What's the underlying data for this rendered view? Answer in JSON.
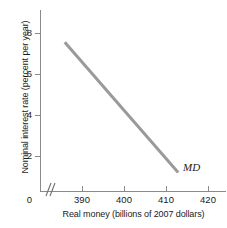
{
  "chart_data": {
    "type": "line",
    "title": "",
    "subtitle": "",
    "xlabel": "Real money (billions of 2007 dollars)",
    "ylabel": "Nominal interest rate (percent per year)",
    "xlim": [
      385,
      422
    ],
    "ylim": [
      0,
      8.9
    ],
    "grid": false,
    "legend_position": "inline-right",
    "axis_break_x": true,
    "origin_label": "0",
    "xticks": [
      390,
      400,
      410,
      420
    ],
    "xtick_labels": [
      "390",
      "400",
      "410",
      "420"
    ],
    "yticks": [
      2,
      4,
      6,
      8
    ],
    "ytick_labels": [
      "2",
      "4",
      "6",
      "8"
    ],
    "series": [
      {
        "name": "MD",
        "label": "MD",
        "color": "#9a9a9a",
        "linewidth": 3,
        "x": [
          385.9,
          412.9
        ],
        "values": [
          7.55,
          1.2
        ],
        "annotation": "MD"
      }
    ],
    "annotations": [
      {
        "text": "MD",
        "x": 414.5,
        "y": 1.5
      }
    ]
  },
  "colors": {
    "curve": "#9a9a9a",
    "axis": "#8a8a8a",
    "text": "#1a1a1a",
    "background": "#ffffff"
  }
}
